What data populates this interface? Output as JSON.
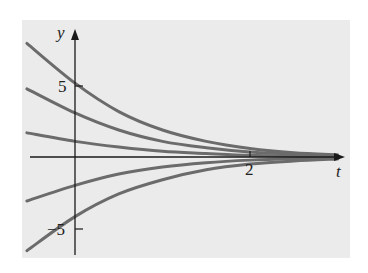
{
  "chart_data": {
    "type": "line",
    "title": "",
    "xlabel": "t",
    "ylabel": "y",
    "x_ticks": [
      {
        "value": 2,
        "label": "2"
      }
    ],
    "y_ticks": [
      {
        "value": 5,
        "label": "5"
      },
      {
        "value": -5,
        "label": "−5"
      }
    ],
    "xlim": [
      -0.55,
      3.1
    ],
    "ylim": [
      -7,
      8.2
    ],
    "grid": false,
    "legend": null,
    "series": [
      {
        "name": "curve-1",
        "points": [
          [
            -0.55,
            8.0
          ],
          [
            0,
            5.2
          ],
          [
            0.5,
            3.2
          ],
          [
            1,
            1.9
          ],
          [
            1.5,
            1.1
          ],
          [
            2,
            0.6
          ],
          [
            2.5,
            0.3
          ],
          [
            3.0,
            0.15
          ]
        ]
      },
      {
        "name": "curve-2",
        "points": [
          [
            -0.55,
            4.8
          ],
          [
            0,
            3.1
          ],
          [
            0.5,
            1.9
          ],
          [
            1,
            1.1
          ],
          [
            1.5,
            0.65
          ],
          [
            2,
            0.35
          ],
          [
            2.5,
            0.2
          ],
          [
            3.0,
            0.1
          ]
        ]
      },
      {
        "name": "curve-3",
        "points": [
          [
            -0.55,
            1.7
          ],
          [
            0,
            1.1
          ],
          [
            0.5,
            0.7
          ],
          [
            1,
            0.4
          ],
          [
            1.5,
            0.25
          ],
          [
            2,
            0.12
          ],
          [
            2.5,
            0.07
          ],
          [
            3.0,
            0.03
          ]
        ]
      },
      {
        "name": "curve-4",
        "points": [
          [
            -0.55,
            -3.1
          ],
          [
            0,
            -2.0
          ],
          [
            0.5,
            -1.2
          ],
          [
            1,
            -0.7
          ],
          [
            1.5,
            -0.4
          ],
          [
            2,
            -0.22
          ],
          [
            2.5,
            -0.12
          ],
          [
            3.0,
            -0.06
          ]
        ]
      },
      {
        "name": "curve-5",
        "points": [
          [
            -0.55,
            -6.6
          ],
          [
            0,
            -4.2
          ],
          [
            0.5,
            -2.6
          ],
          [
            1,
            -1.6
          ],
          [
            1.5,
            -0.9
          ],
          [
            2,
            -0.5
          ],
          [
            2.5,
            -0.28
          ],
          [
            3.0,
            -0.14
          ]
        ]
      }
    ]
  },
  "style": {
    "panel_color": "#ebebeb",
    "curve_color": "#6b6b6b",
    "axis_color": "#1a1a1a"
  }
}
